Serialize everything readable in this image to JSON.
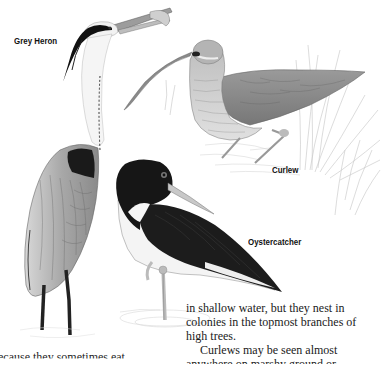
{
  "labels": {
    "heron": "Grey Heron",
    "curlew": "Curlew",
    "oystercatcher": "Oystercatcher"
  },
  "text_right": {
    "line1": "in shallow water, but they nest in",
    "line2": "colonies in the topmost branches of",
    "line3": "high trees.",
    "line4": "Curlews may be seen almost",
    "line5": "anywhere on marshy ground or"
  },
  "text_left": {
    "line1": "because they sometimes eat"
  },
  "illustrations": [
    {
      "name": "grey-heron",
      "caption": "Grey Heron"
    },
    {
      "name": "curlew",
      "caption": "Curlew"
    },
    {
      "name": "oystercatcher",
      "caption": "Oystercatcher"
    }
  ]
}
